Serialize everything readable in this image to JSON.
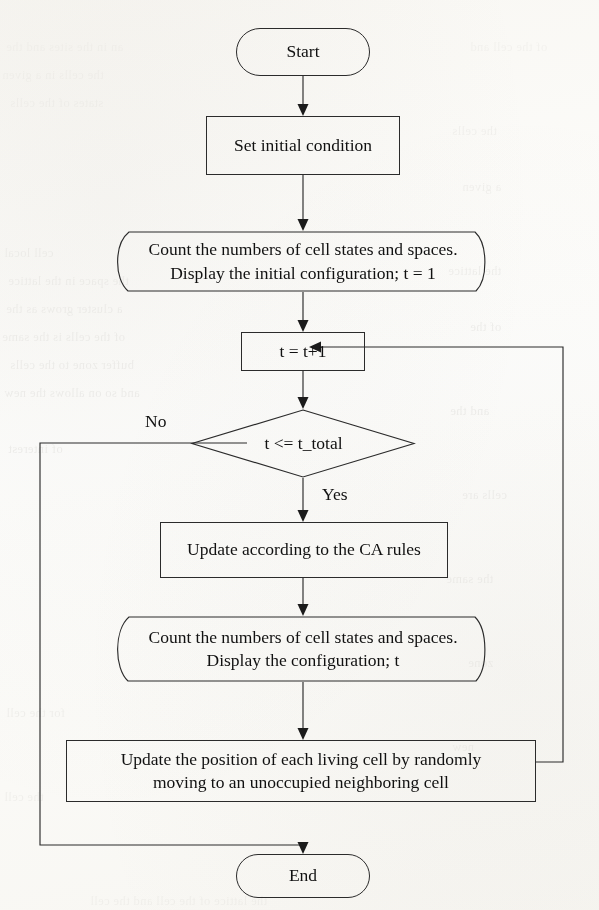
{
  "document": {
    "type": "flowchart",
    "title": "Cellular automata simulation flowchart",
    "background_color": "#fdfdfb",
    "ink_color": "#2b2b2b"
  },
  "flowchart": {
    "orientation": "top-to-bottom",
    "nodes": [
      {
        "id": "start",
        "shape": "terminator",
        "label": "Start"
      },
      {
        "id": "init",
        "shape": "process",
        "label": "Set initial condition"
      },
      {
        "id": "count_init",
        "shape": "display",
        "line1": "Count the numbers of cell states and spaces.",
        "line2": "Display the initial configuration; t = 1"
      },
      {
        "id": "increment",
        "shape": "process",
        "label": "t = t+1"
      },
      {
        "id": "check",
        "shape": "decision",
        "label": "t <= t_total"
      },
      {
        "id": "update_rules",
        "shape": "process",
        "label": "Update according to the CA rules"
      },
      {
        "id": "count_loop",
        "shape": "display",
        "line1": "Count the numbers of cell states and spaces.",
        "line2": "Display the configuration; t"
      },
      {
        "id": "move_cells",
        "shape": "process",
        "line1": "Update the position of each living cell by randomly",
        "line2": "moving to an unoccupied neighboring cell"
      },
      {
        "id": "end",
        "shape": "terminator",
        "label": "End"
      }
    ],
    "edge_labels": {
      "no": "No",
      "yes": "Yes"
    },
    "edges": [
      {
        "from": "start",
        "to": "init",
        "label": ""
      },
      {
        "from": "init",
        "to": "count_init",
        "label": ""
      },
      {
        "from": "count_init",
        "to": "increment",
        "label": ""
      },
      {
        "from": "increment",
        "to": "check",
        "label": ""
      },
      {
        "from": "check",
        "to": "end",
        "label": "No"
      },
      {
        "from": "check",
        "to": "update_rules",
        "label": "Yes"
      },
      {
        "from": "update_rules",
        "to": "count_loop",
        "label": ""
      },
      {
        "from": "count_loop",
        "to": "move_cells",
        "label": ""
      },
      {
        "from": "move_cells",
        "to": "increment",
        "label": ""
      }
    ]
  },
  "bleed_through": {
    "note": "faint mirrored text showing through from the reverse side of the scanned page",
    "left_column": [
      "an   in  the   sites   and   the",
      "the   cells   in   a   given",
      "states   of   the   cells",
      "",
      "",
      "",
      "",
      "cell   local",
      "the  space  in  the  lattice",
      "a   cluster   grows   as   the",
      "of  the  cells  is  the  same",
      "buffer  zone  to  the  cells",
      "and  so  on  allows  the  new",
      "",
      "of   interest",
      "",
      "",
      "",
      "",
      "",
      "",
      "",
      "",
      "",
      "",
      "",
      "",
      "",
      "for   the   cell",
      "",
      "",
      "the   cell"
    ],
    "right_column": [
      "of   the   cell   and",
      "",
      "",
      "",
      "",
      "",
      "",
      "",
      "",
      "",
      "",
      "",
      "",
      "",
      "",
      "",
      "",
      "",
      "",
      "",
      "",
      "",
      "",
      "",
      "",
      "",
      "",
      "",
      "",
      "",
      "",
      ""
    ],
    "footer": "the   lattice   of   the   cell   and   the   cell"
  }
}
